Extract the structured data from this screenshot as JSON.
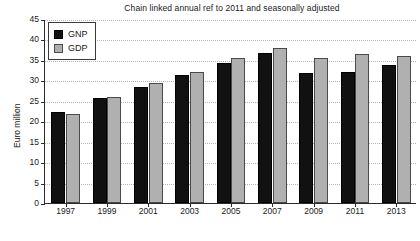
{
  "chart_data": {
    "type": "bar",
    "title": "Chain linked annual ref to 2011 and seasonally adjusted",
    "xlabel": "",
    "ylabel": "Euro million",
    "categories": [
      "1997",
      "1999",
      "2001",
      "2003",
      "2005",
      "2007",
      "2009",
      "2011",
      "2013"
    ],
    "series": [
      {
        "name": "GNP",
        "color": "#111111",
        "values": [
          22.3,
          25.7,
          28.3,
          31.3,
          34.3,
          36.6,
          31.8,
          32.0,
          33.8
        ]
      },
      {
        "name": "GDP",
        "color": "#b0b0b0",
        "values": [
          21.8,
          25.9,
          29.4,
          32.1,
          35.5,
          38.0,
          35.5,
          36.5,
          36.0
        ]
      }
    ],
    "ylim": [
      0,
      45
    ],
    "yticks": [
      0,
      5,
      10,
      15,
      20,
      25,
      30,
      35,
      40,
      45
    ],
    "ytick_labels": [
      "0",
      "5",
      "10",
      "15",
      "20",
      "25",
      "30",
      "35",
      "40",
      "45"
    ],
    "grid": true,
    "grid_style": "dotted",
    "legend_position": "top-left"
  },
  "legend": {
    "items": [
      {
        "label": "GNP"
      },
      {
        "label": "GDP"
      }
    ]
  },
  "bottom_caption": "",
  "colors": {
    "gnp": "#111111",
    "gdp": "#b0b0b0",
    "axis": "#2b2b2b",
    "grid": "#b4b4b4",
    "text": "#1a1a1a",
    "background": "#ffffff"
  }
}
